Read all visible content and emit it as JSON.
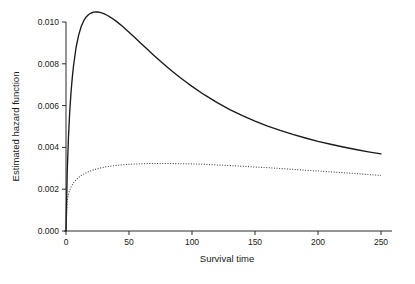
{
  "chart_data": {
    "type": "line",
    "title": "",
    "xlabel": "Survival time",
    "ylabel": "Estimated hazard function",
    "xlim": [
      0,
      256
    ],
    "ylim": [
      0,
      0.0105
    ],
    "grid": false,
    "legend": "none",
    "xticks": [
      0,
      50,
      100,
      150,
      200,
      250
    ],
    "xticklabels": [
      "0",
      "50",
      "100",
      "150",
      "200",
      "250"
    ],
    "yticks": [
      0.0,
      0.002,
      0.004,
      0.006,
      0.008,
      0.01
    ],
    "yticklabels": [
      "0.000",
      "0.002",
      "0.004",
      "0.006",
      "0.008",
      "0.010"
    ],
    "series": [
      {
        "name": "group-1-hazard",
        "style": "solid",
        "color": "#1a1a1a",
        "x": [
          0,
          1,
          2,
          3,
          4,
          5,
          6,
          8,
          10,
          12,
          14,
          16,
          18,
          20,
          22,
          24,
          25,
          27,
          30,
          33,
          36,
          40,
          45,
          50,
          55,
          60,
          65,
          70,
          75,
          80,
          85,
          90,
          95,
          100,
          110,
          120,
          130,
          140,
          150,
          160,
          170,
          180,
          190,
          200,
          210,
          220,
          230,
          240,
          250
        ],
        "y": [
          0.0,
          0.0029,
          0.00455,
          0.00575,
          0.00665,
          0.00735,
          0.00792,
          0.00878,
          0.00936,
          0.00977,
          0.01005,
          0.01024,
          0.01036,
          0.01043,
          0.01047,
          0.01048,
          0.01048,
          0.01046,
          0.0104,
          0.01031,
          0.0102,
          0.01003,
          0.00978,
          0.00951,
          0.00923,
          0.00895,
          0.00867,
          0.00839,
          0.00812,
          0.00786,
          0.00761,
          0.00737,
          0.00714,
          0.00692,
          0.00651,
          0.00614,
          0.00581,
          0.00552,
          0.00526,
          0.00502,
          0.00481,
          0.00462,
          0.00445,
          0.00429,
          0.00415,
          0.00402,
          0.0039,
          0.00379,
          0.00369
        ]
      },
      {
        "name": "group-2-hazard",
        "style": "dotted",
        "color": "#3a3a3a",
        "x": [
          0,
          1,
          2,
          3,
          4,
          5,
          6,
          8,
          10,
          12,
          15,
          18,
          21,
          25,
          30,
          35,
          40,
          45,
          50,
          60,
          70,
          80,
          90,
          100,
          110,
          120,
          130,
          140,
          150,
          160,
          170,
          180,
          190,
          200,
          210,
          220,
          230,
          240,
          250
        ],
        "y": [
          0.0,
          0.00148,
          0.00178,
          0.00196,
          0.0021,
          0.00221,
          0.00231,
          0.00245,
          0.00256,
          0.00265,
          0.00276,
          0.00284,
          0.00291,
          0.00298,
          0.00305,
          0.0031,
          0.00314,
          0.00317,
          0.00319,
          0.00322,
          0.00323,
          0.00323,
          0.00322,
          0.00321,
          0.00319,
          0.00316,
          0.00313,
          0.0031,
          0.00306,
          0.00303,
          0.00299,
          0.00295,
          0.00291,
          0.00287,
          0.00283,
          0.00279,
          0.00275,
          0.0027,
          0.00266
        ]
      }
    ]
  },
  "axes": {
    "x_axis_name": "survival-time-axis",
    "y_axis_name": "estimated-hazard-axis"
  }
}
